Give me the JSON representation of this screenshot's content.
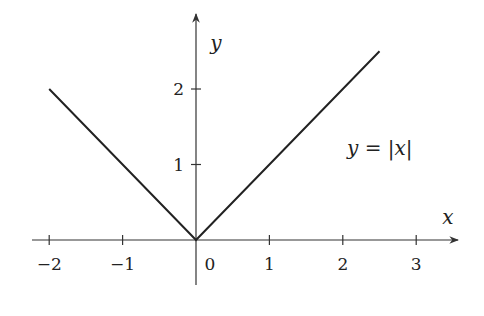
{
  "chart_data": {
    "type": "line",
    "title": "",
    "xlabel": "x",
    "ylabel": "y",
    "xlim": [
      -2.2,
      3.6
    ],
    "ylim": [
      -0.6,
      3.0
    ],
    "grid": false,
    "legend": null,
    "x_ticks": [
      -2,
      -1,
      0,
      1,
      2,
      3
    ],
    "x_tick_labels": [
      "−2",
      "−1",
      "0",
      "1",
      "2",
      "3"
    ],
    "y_ticks": [
      1,
      2
    ],
    "y_tick_labels": [
      "1",
      "2"
    ],
    "series": [
      {
        "name": "y = |x|",
        "x": [
          -2,
          0,
          2.5
        ],
        "y": [
          2,
          0,
          2.5
        ]
      }
    ],
    "annotations": [
      {
        "text": "y = |x|",
        "x": 2.35,
        "y": 1.25
      }
    ]
  },
  "colors": {
    "axis": "#333333",
    "line": "#222222",
    "text": "#222222",
    "background": "#ffffff"
  }
}
